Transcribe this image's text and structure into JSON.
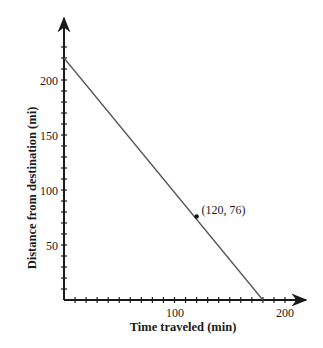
{
  "chart_data": {
    "type": "line",
    "title": "",
    "xlabel": "Time traveled (min)",
    "ylabel": "Distance from destination (mi)",
    "xlim": [
      0,
      210
    ],
    "ylim": [
      0,
      235
    ],
    "x_ticks": [
      100,
      200
    ],
    "y_ticks": [
      50,
      100,
      150,
      200
    ],
    "minor_tick_interval": 10,
    "grid": false,
    "legend": null,
    "series": [
      {
        "name": "distance",
        "x": [
          0,
          180
        ],
        "y": [
          220,
          0
        ]
      }
    ],
    "annotations": [
      {
        "x": 120,
        "y": 76,
        "text": "(120, 76)"
      }
    ]
  },
  "labels": {
    "x_tick_100": "100",
    "x_tick_200": "200",
    "y_tick_50": "50",
    "y_tick_100": "100",
    "y_tick_150": "150",
    "y_tick_200": "200",
    "xlabel": "Time traveled (min)",
    "ylabel": "Distance from destination (mi)",
    "point_label": "(120, 76)"
  },
  "colors": {
    "axis": "#1a1a1a",
    "line": "#555555",
    "point": "#111111"
  }
}
